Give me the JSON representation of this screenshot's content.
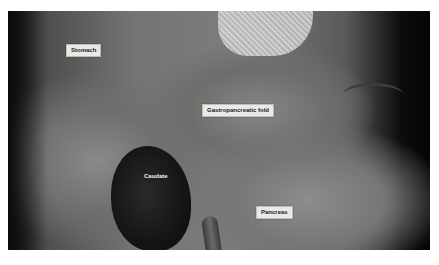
{
  "image": {
    "description": "Grayscale laparoscopic view with anatomical labels",
    "labels": {
      "stomach": "Stomach",
      "gastropancreatic_fold": "Gastropancreatic fold",
      "caudate": "Caudate",
      "pancreas": "Pancreas"
    }
  }
}
